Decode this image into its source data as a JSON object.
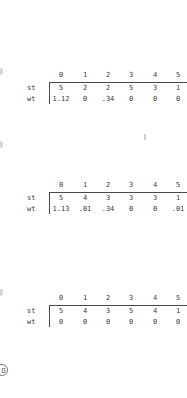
{
  "tables": [
    {
      "columns": [
        "0",
        "1",
        "2",
        "3",
        "4",
        "5"
      ],
      "rows": [
        {
          "label": "st",
          "values": [
            "5",
            "2",
            "2",
            "5",
            "3",
            "1"
          ]
        },
        {
          "label": "wt",
          "values": [
            "1.12",
            "0",
            ".34",
            "0",
            "0",
            "0"
          ]
        }
      ]
    },
    {
      "columns": [
        "0",
        "1",
        "2",
        "3",
        "4",
        "5"
      ],
      "rows": [
        {
          "label": "st",
          "values": [
            "5",
            "4",
            "3",
            "3",
            "3",
            "1"
          ]
        },
        {
          "label": "wt",
          "values": [
            "1.13",
            ".01",
            ".34",
            "0",
            "0",
            ".01"
          ]
        }
      ]
    },
    {
      "columns": [
        "0",
        "1",
        "2",
        "3",
        "4",
        "5"
      ],
      "rows": [
        {
          "label": "st",
          "values": [
            "5",
            "4",
            "3",
            "5",
            "4",
            "1"
          ]
        },
        {
          "label": "wt",
          "values": [
            "0",
            "0",
            "0",
            "0",
            "0",
            "0"
          ]
        }
      ]
    }
  ],
  "marker": {
    "label": "0"
  }
}
